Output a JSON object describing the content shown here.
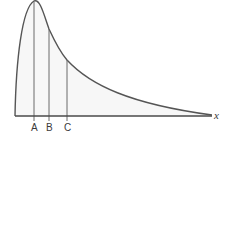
{
  "diagram": {
    "type": "right-skewed distribution curve",
    "colors": {
      "curve": "#555555",
      "fill": "#f7f7f7",
      "axis": "#4a4a4a",
      "marker_lines": "#6a6a6a",
      "text": "#3a3a3a"
    },
    "axis": {
      "label": "x"
    },
    "markers": [
      {
        "label": "A",
        "meaning": "peak (mode)"
      },
      {
        "label": "B",
        "meaning": "middle marker"
      },
      {
        "label": "C",
        "meaning": "rightmost marker"
      }
    ]
  }
}
